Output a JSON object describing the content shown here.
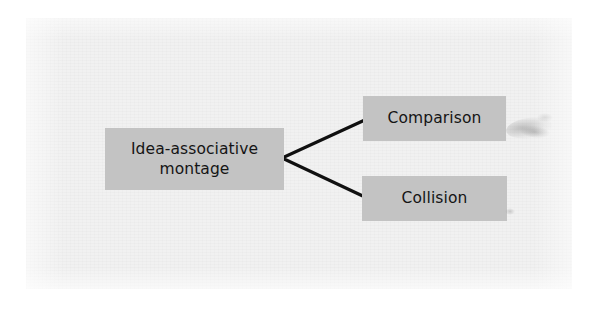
{
  "figure": {
    "type": "tree-diagram",
    "orientation": "left-to-right",
    "background_color": "#f1f1f1",
    "node_fill_color": "#c3c3c3",
    "node_text_color": "#151515",
    "connector_color": "#101010"
  },
  "nodes": {
    "root": {
      "id": "idea-associative-montage",
      "label": "Idea-associative\nmontage",
      "line_1": "Idea-associative",
      "line_2": "montage",
      "role": "parent"
    },
    "children": [
      {
        "id": "comparison",
        "label": "Comparison",
        "role": "child"
      },
      {
        "id": "collision",
        "label": "Collision",
        "role": "child"
      }
    ]
  },
  "connectors": [
    {
      "id": "root-to-comparison",
      "from": "idea-associative-montage",
      "to": "comparison",
      "vertex": "282,158",
      "endpoint": "367,119"
    },
    {
      "id": "root-to-collision",
      "from": "idea-associative-montage",
      "to": "collision",
      "vertex": "282,158",
      "endpoint": "367,198"
    }
  ],
  "artifacts": {
    "smudge_1": "scan-smudge",
    "smudge_2": "scan-smudge",
    "smudge_3": "scan-speck",
    "smudge_4": "scan-speck"
  }
}
